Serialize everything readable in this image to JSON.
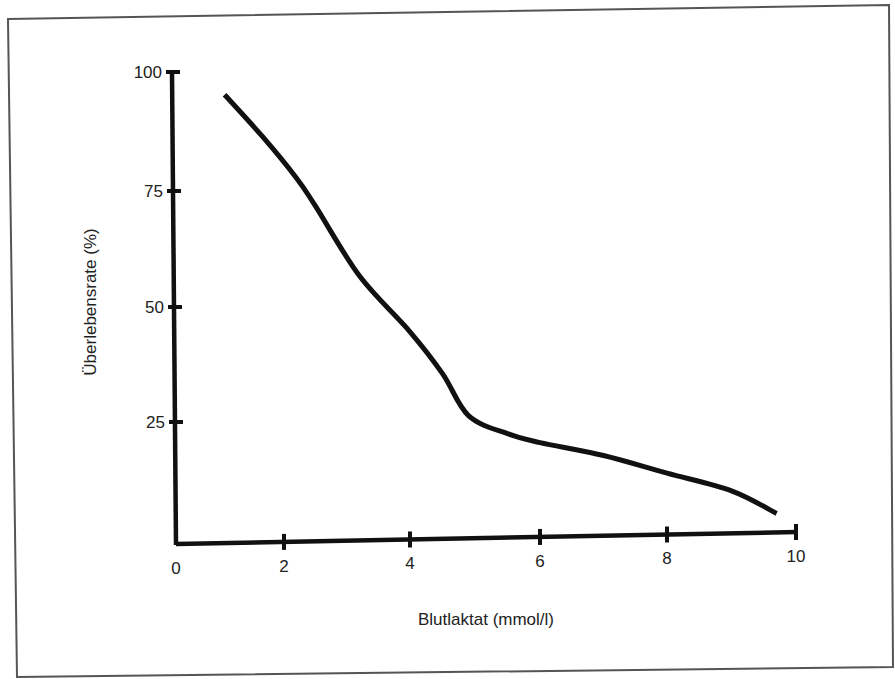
{
  "chart_data": {
    "type": "line",
    "title": "",
    "xlabel": "Blutlaktat (mmol/l)",
    "ylabel": "Überlebensrate (%)",
    "xlim": [
      0,
      10
    ],
    "ylim": [
      0,
      100
    ],
    "x_ticks": [
      "0",
      "2",
      "4",
      "6",
      "8",
      "10"
    ],
    "y_ticks": [
      "25",
      "50",
      "75",
      "100"
    ],
    "grid": false,
    "legend": null,
    "series": [
      {
        "name": "Überlebensrate",
        "x": [
          0.9,
          1.6,
          2.2,
          2.5,
          3.2,
          4.0,
          4.5,
          4.9,
          5.5,
          6.0,
          7.0,
          8.0,
          9.0,
          9.7
        ],
        "values": [
          95,
          86,
          77,
          71,
          56,
          44,
          35,
          26,
          22,
          20,
          17,
          13,
          9,
          4
        ]
      }
    ]
  },
  "colors": {
    "line": "#111111",
    "axis": "#111111",
    "frame": "#555555",
    "background": "#ffffff"
  }
}
